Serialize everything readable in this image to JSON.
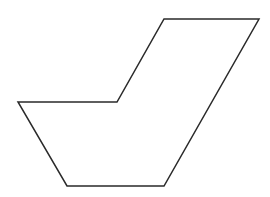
{
  "diagram": {
    "type": "polygon-outline",
    "shape": "hexagon",
    "background": "#ffffff",
    "stroke_color": "#2a2a2a",
    "stroke_width": 1.5,
    "fill": "none",
    "vertices": [
      [
        164,
        19
      ],
      [
        259,
        19
      ],
      [
        164,
        186
      ],
      [
        67,
        186
      ],
      [
        18,
        102
      ],
      [
        117,
        102
      ]
    ]
  }
}
